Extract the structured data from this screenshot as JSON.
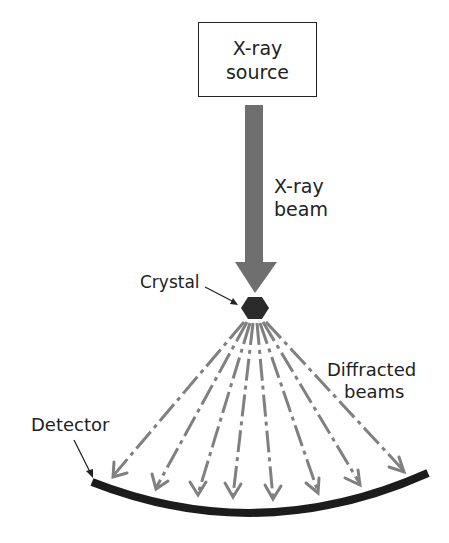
{
  "diagram": {
    "source_label": [
      "X-ray",
      "source"
    ],
    "beam_label": [
      "X-ray",
      "beam"
    ],
    "crystal_label": "Crystal",
    "diffracted_label": [
      "Diffracted",
      "beams"
    ],
    "detector_label": "Detector",
    "colors": {
      "beam": "#6f6f6f",
      "crystal": "#2b2b2b",
      "detector": "#1c1c1c",
      "diffracted": "#808080",
      "text": "#222222"
    },
    "diffracted_beam_count": 8
  }
}
